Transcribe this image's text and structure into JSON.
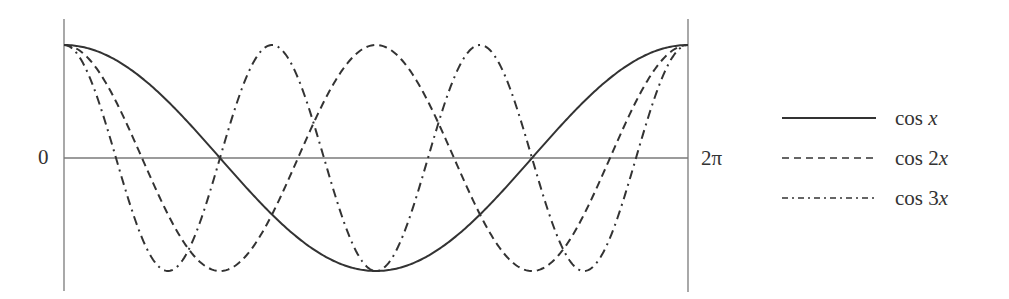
{
  "chart_data": {
    "type": "line",
    "title": "",
    "xlabel": "",
    "ylabel": "",
    "x_range": [
      0,
      6.283185307179586
    ],
    "ylim": [
      -1,
      1
    ],
    "grid": false,
    "legend_position": "right",
    "tick_labels": {
      "y_zero": "0",
      "x_end": "2π"
    },
    "series": [
      {
        "name": "cos x",
        "function": "cos(x)",
        "style": "solid",
        "x": [
          0,
          1.5708,
          3.1416,
          4.7124,
          6.2832
        ],
        "values": [
          1,
          0,
          -1,
          0,
          1
        ]
      },
      {
        "name": "cos 2x",
        "function": "cos(2x)",
        "style": "dashed",
        "x": [
          0,
          0.7854,
          1.5708,
          2.3562,
          3.1416,
          3.927,
          4.7124,
          5.4978,
          6.2832
        ],
        "values": [
          1,
          0,
          -1,
          0,
          1,
          0,
          -1,
          0,
          1
        ]
      },
      {
        "name": "cos 3x",
        "function": "cos(3x)",
        "style": "dash-dot",
        "x": [
          0,
          0.5236,
          1.0472,
          1.5708,
          2.0944,
          2.618,
          3.1416,
          3.6652,
          4.1888,
          4.7124,
          5.236,
          5.7596,
          6.2832
        ],
        "values": [
          1,
          0,
          -1,
          0,
          1,
          0,
          -1,
          0,
          1,
          0,
          -1,
          0,
          1
        ]
      }
    ]
  },
  "axes": {
    "zero_label": "0",
    "end_label": "2π"
  },
  "legend": {
    "items": [
      {
        "prefix": "cos ",
        "var": "x",
        "coef": "",
        "style": "solid"
      },
      {
        "prefix": "cos ",
        "var": "x",
        "coef": "2",
        "style": "dashed"
      },
      {
        "prefix": "cos ",
        "var": "x",
        "coef": "3",
        "style": "dash-dot"
      }
    ]
  },
  "colors": {
    "curve": "#333333",
    "axis": "#777777",
    "background": "#ffffff"
  }
}
